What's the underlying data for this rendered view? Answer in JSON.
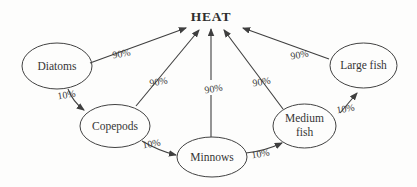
{
  "diagram": {
    "title": "HEAT",
    "colors": {
      "background": "#fdfdfc",
      "ink": "#3f3f3f"
    },
    "nodes": {
      "diatoms": {
        "label": "Diatoms"
      },
      "copepods": {
        "label": "Copepods"
      },
      "minnows": {
        "label": "Minnows"
      },
      "medium_fish": {
        "label_line1": "Medium",
        "label_line2": "fish"
      },
      "large_fish": {
        "label": "Large fish"
      }
    },
    "heat_arrows": [
      {
        "from": "Diatoms",
        "to": "HEAT",
        "label": "90%"
      },
      {
        "from": "Copepods",
        "to": "HEAT",
        "label": "90%"
      },
      {
        "from": "Minnows",
        "to": "HEAT",
        "label": "90%"
      },
      {
        "from": "Medium fish",
        "to": "HEAT",
        "label": "90%"
      },
      {
        "from": "Large fish",
        "to": "HEAT",
        "label": "90%"
      }
    ],
    "transfer_arrows": [
      {
        "from": "Diatoms",
        "to": "Copepods",
        "label": "10%"
      },
      {
        "from": "Copepods",
        "to": "Minnows",
        "label": "10%"
      },
      {
        "from": "Minnows",
        "to": "Medium fish",
        "label": "10%"
      },
      {
        "from": "Medium fish",
        "to": "Large fish",
        "label": "10%"
      }
    ]
  }
}
